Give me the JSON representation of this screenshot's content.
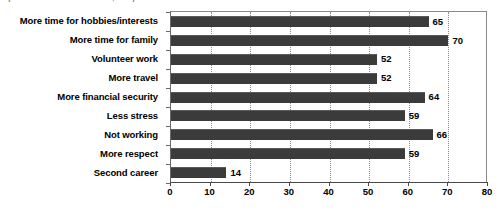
{
  "caption": {
    "source_text": "(Source: Pew Research Center, 2005)"
  },
  "chart_data": {
    "type": "bar",
    "orientation": "horizontal",
    "title": "",
    "subtitle": "",
    "xlabel": "",
    "ylabel": "",
    "xlim": [
      0,
      80
    ],
    "xticks": [
      0,
      10,
      20,
      30,
      40,
      50,
      60,
      70,
      80
    ],
    "xtick_labels": [
      "0",
      "10",
      "20",
      "30",
      "40",
      "50",
      "60",
      "70",
      "80"
    ],
    "grid": "vertical-dotted",
    "legend": "none",
    "bar_color": "#3b3b3b",
    "categories": [
      "More time for hobbies/interests",
      "More time for family",
      "Volunteer work",
      "More travel",
      "More financial security",
      "Less stress",
      "Not working",
      "More respect",
      "Second career"
    ],
    "values": [
      65,
      70,
      52,
      52,
      64,
      59,
      66,
      59,
      14
    ],
    "value_labels": [
      "65",
      "70",
      "52",
      "52",
      "64",
      "59",
      "66",
      "59",
      "14"
    ]
  }
}
